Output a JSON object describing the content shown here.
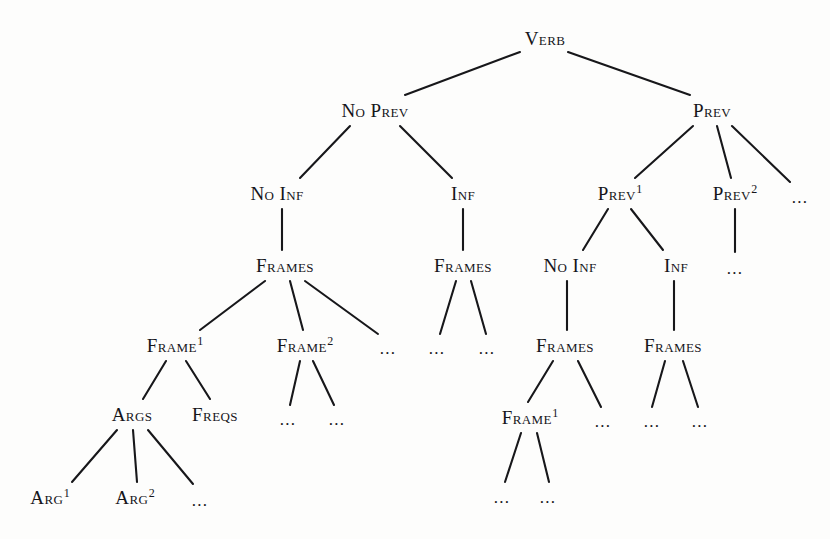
{
  "figure": {
    "type": "tree-diagram",
    "background_color": "#fdfdfc",
    "ink_color": "#15151a",
    "width": 830,
    "height": 539
  },
  "nodes": [
    {
      "id": "verb",
      "label": "Verb",
      "sup": "",
      "x": 545,
      "y": 38,
      "kind": "label"
    },
    {
      "id": "no-prev",
      "label": "No Prev",
      "sup": "",
      "x": 375,
      "y": 110,
      "kind": "label"
    },
    {
      "id": "prev",
      "label": "Prev",
      "sup": "",
      "x": 712,
      "y": 110,
      "kind": "label"
    },
    {
      "id": "no-inf-a",
      "label": "No Inf",
      "sup": "",
      "x": 277,
      "y": 193,
      "kind": "label"
    },
    {
      "id": "inf-a",
      "label": "Inf",
      "sup": "",
      "x": 463,
      "y": 193,
      "kind": "label"
    },
    {
      "id": "prev-1",
      "label": "Prev",
      "sup": "1",
      "x": 620,
      "y": 193,
      "kind": "label"
    },
    {
      "id": "prev-2",
      "label": "Prev",
      "sup": "2",
      "x": 735,
      "y": 193,
      "kind": "label"
    },
    {
      "id": "ell-prev-3",
      "label": "...",
      "sup": "",
      "x": 800,
      "y": 197,
      "kind": "ellipsis"
    },
    {
      "id": "frames-a",
      "label": "Frames",
      "sup": "",
      "x": 285,
      "y": 265,
      "kind": "label"
    },
    {
      "id": "frames-b",
      "label": "Frames",
      "sup": "",
      "x": 463,
      "y": 265,
      "kind": "label"
    },
    {
      "id": "no-inf-b",
      "label": "No Inf",
      "sup": "",
      "x": 570,
      "y": 265,
      "kind": "label"
    },
    {
      "id": "inf-b",
      "label": "Inf",
      "sup": "",
      "x": 676,
      "y": 265,
      "kind": "label"
    },
    {
      "id": "ell-prev2-child",
      "label": "...",
      "sup": "",
      "x": 735,
      "y": 268,
      "kind": "ellipsis"
    },
    {
      "id": "frame-1-a",
      "label": "Frame",
      "sup": "1",
      "x": 175,
      "y": 345,
      "kind": "label"
    },
    {
      "id": "frame-2-a",
      "label": "Frame",
      "sup": "2",
      "x": 305,
      "y": 345,
      "kind": "label"
    },
    {
      "id": "ell-frames-a-3",
      "label": "...",
      "sup": "",
      "x": 388,
      "y": 348,
      "kind": "ellipsis"
    },
    {
      "id": "ell-frames-b-1",
      "label": "...",
      "sup": "",
      "x": 437,
      "y": 348,
      "kind": "ellipsis"
    },
    {
      "id": "ell-frames-b-2",
      "label": "...",
      "sup": "",
      "x": 487,
      "y": 348,
      "kind": "ellipsis"
    },
    {
      "id": "frames-c",
      "label": "Frames",
      "sup": "",
      "x": 565,
      "y": 345,
      "kind": "label"
    },
    {
      "id": "frames-d",
      "label": "Frames",
      "sup": "",
      "x": 673,
      "y": 345,
      "kind": "label"
    },
    {
      "id": "args",
      "label": "Args",
      "sup": "",
      "x": 132,
      "y": 414,
      "kind": "label"
    },
    {
      "id": "freqs",
      "label": "Freqs",
      "sup": "",
      "x": 215,
      "y": 414,
      "kind": "label"
    },
    {
      "id": "ell-frame2a-1",
      "label": "...",
      "sup": "",
      "x": 288,
      "y": 419,
      "kind": "ellipsis"
    },
    {
      "id": "ell-frame2a-2",
      "label": "...",
      "sup": "",
      "x": 337,
      "y": 419,
      "kind": "ellipsis"
    },
    {
      "id": "frame-1-b",
      "label": "Frame",
      "sup": "1",
      "x": 530,
      "y": 417,
      "kind": "label"
    },
    {
      "id": "ell-framesc-2",
      "label": "...",
      "sup": "",
      "x": 603,
      "y": 421,
      "kind": "ellipsis"
    },
    {
      "id": "ell-framesd-1",
      "label": "...",
      "sup": "",
      "x": 652,
      "y": 421,
      "kind": "ellipsis"
    },
    {
      "id": "ell-framesd-2",
      "label": "...",
      "sup": "",
      "x": 700,
      "y": 421,
      "kind": "ellipsis"
    },
    {
      "id": "arg-1",
      "label": "Arg",
      "sup": "1",
      "x": 50,
      "y": 497,
      "kind": "label"
    },
    {
      "id": "arg-2",
      "label": "Arg",
      "sup": "2",
      "x": 135,
      "y": 497,
      "kind": "label"
    },
    {
      "id": "ell-args-3",
      "label": "...",
      "sup": "",
      "x": 200,
      "y": 500,
      "kind": "ellipsis"
    },
    {
      "id": "ell-frame1b-1",
      "label": "...",
      "sup": "",
      "x": 502,
      "y": 497,
      "kind": "ellipsis"
    },
    {
      "id": "ell-frame1b-2",
      "label": "...",
      "sup": "",
      "x": 548,
      "y": 497,
      "kind": "ellipsis"
    }
  ],
  "edges": [
    {
      "from": "verb",
      "to": "no-prev",
      "x1": 520,
      "y1": 52,
      "x2": 405,
      "y2": 95
    },
    {
      "from": "verb",
      "to": "prev",
      "x1": 568,
      "y1": 52,
      "x2": 690,
      "y2": 95
    },
    {
      "from": "no-prev",
      "to": "no-inf-a",
      "x1": 350,
      "y1": 126,
      "x2": 300,
      "y2": 178
    },
    {
      "from": "no-prev",
      "to": "inf-a",
      "x1": 400,
      "y1": 126,
      "x2": 452,
      "y2": 178
    },
    {
      "from": "prev",
      "to": "prev-1",
      "x1": 693,
      "y1": 126,
      "x2": 635,
      "y2": 178
    },
    {
      "from": "prev",
      "to": "prev-2",
      "x1": 717,
      "y1": 126,
      "x2": 731,
      "y2": 178
    },
    {
      "from": "prev",
      "to": "ell-prev-3",
      "x1": 732,
      "y1": 126,
      "x2": 790,
      "y2": 182
    },
    {
      "from": "no-inf-a",
      "to": "frames-a",
      "x1": 282,
      "y1": 209,
      "x2": 282,
      "y2": 250
    },
    {
      "from": "inf-a",
      "to": "frames-b",
      "x1": 463,
      "y1": 209,
      "x2": 463,
      "y2": 250
    },
    {
      "from": "prev-1",
      "to": "no-inf-b",
      "x1": 608,
      "y1": 209,
      "x2": 583,
      "y2": 250
    },
    {
      "from": "prev-1",
      "to": "inf-b",
      "x1": 631,
      "y1": 209,
      "x2": 663,
      "y2": 250
    },
    {
      "from": "prev-2",
      "to": "ell-prev2-child",
      "x1": 735,
      "y1": 209,
      "x2": 735,
      "y2": 252
    },
    {
      "from": "frames-a",
      "to": "frame-1-a",
      "x1": 265,
      "y1": 281,
      "x2": 200,
      "y2": 330
    },
    {
      "from": "frames-a",
      "to": "frame-2-a",
      "x1": 290,
      "y1": 281,
      "x2": 303,
      "y2": 330
    },
    {
      "from": "frames-a",
      "to": "ell-frames-a-3",
      "x1": 305,
      "y1": 281,
      "x2": 378,
      "y2": 334
    },
    {
      "from": "frames-b",
      "to": "ell-frames-b-1",
      "x1": 456,
      "y1": 281,
      "x2": 440,
      "y2": 334
    },
    {
      "from": "frames-b",
      "to": "ell-frames-b-2",
      "x1": 471,
      "y1": 281,
      "x2": 486,
      "y2": 334
    },
    {
      "from": "no-inf-b",
      "to": "frames-c",
      "x1": 567,
      "y1": 281,
      "x2": 567,
      "y2": 330
    },
    {
      "from": "inf-b",
      "to": "frames-d",
      "x1": 674,
      "y1": 281,
      "x2": 674,
      "y2": 330
    },
    {
      "from": "frames-a2",
      "to": "args",
      "x1": 166,
      "y1": 361,
      "x2": 143,
      "y2": 399
    },
    {
      "from": "frame-1-a",
      "to": "freqs",
      "x1": 186,
      "y1": 361,
      "x2": 210,
      "y2": 399
    },
    {
      "from": "frame-2-a",
      "to": "ell-frame2a-1",
      "x1": 300,
      "y1": 361,
      "x2": 290,
      "y2": 405
    },
    {
      "from": "frame-2-a",
      "to": "ell-frame2a-2",
      "x1": 313,
      "y1": 361,
      "x2": 334,
      "y2": 405
    },
    {
      "from": "frames-c",
      "to": "frame-1-b",
      "x1": 553,
      "y1": 361,
      "x2": 528,
      "y2": 402
    },
    {
      "from": "frames-c",
      "to": "ell-framesc-2",
      "x1": 578,
      "y1": 361,
      "x2": 601,
      "y2": 407
    },
    {
      "from": "frames-d",
      "to": "ell-framesd-1",
      "x1": 665,
      "y1": 361,
      "x2": 652,
      "y2": 407
    },
    {
      "from": "frames-d",
      "to": "ell-framesd-2",
      "x1": 683,
      "y1": 361,
      "x2": 698,
      "y2": 407
    },
    {
      "from": "args",
      "to": "arg-1",
      "x1": 117,
      "y1": 430,
      "x2": 72,
      "y2": 482
    },
    {
      "from": "args",
      "to": "arg-2",
      "x1": 133,
      "y1": 430,
      "x2": 137,
      "y2": 482
    },
    {
      "from": "args",
      "to": "ell-args-3",
      "x1": 148,
      "y1": 430,
      "x2": 193,
      "y2": 484
    },
    {
      "from": "frame-1-b",
      "to": "ell-frame1b-1",
      "x1": 521,
      "y1": 433,
      "x2": 505,
      "y2": 482
    },
    {
      "from": "frame-1-b",
      "to": "ell-frame1b-2",
      "x1": 537,
      "y1": 433,
      "x2": 549,
      "y2": 482
    }
  ]
}
